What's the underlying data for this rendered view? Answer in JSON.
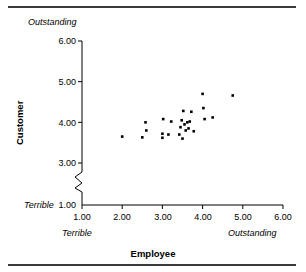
{
  "chart_data": {
    "type": "scatter",
    "title": "",
    "xlabel": "Employee",
    "ylabel": "Customer",
    "xlim": [
      1.0,
      6.0
    ],
    "ylim": [
      1.0,
      6.0
    ],
    "grid": false,
    "legend": null,
    "y_axis_break": true,
    "y_axis_break_between": [
      1.0,
      3.0
    ],
    "x_ticks": [
      "1.00",
      "2.00",
      "3.00",
      "4.00",
      "5.00",
      "6.00"
    ],
    "y_ticks": [
      "1.00",
      "3.00",
      "4.00",
      "5.00",
      "6.00"
    ],
    "x_scale_low_label": "Terrible",
    "x_scale_high_label": "Outstanding",
    "y_scale_low_label": "Terrible",
    "y_scale_high_label": "Outstanding",
    "marker": "square",
    "marker_color": "#000000",
    "points": [
      {
        "x": 2.0,
        "y": 3.65
      },
      {
        "x": 2.5,
        "y": 3.63
      },
      {
        "x": 2.58,
        "y": 4.0
      },
      {
        "x": 2.6,
        "y": 3.8
      },
      {
        "x": 3.0,
        "y": 3.72
      },
      {
        "x": 3.0,
        "y": 3.62
      },
      {
        "x": 3.02,
        "y": 4.08
      },
      {
        "x": 3.15,
        "y": 3.7
      },
      {
        "x": 3.22,
        "y": 4.02
      },
      {
        "x": 3.42,
        "y": 3.7
      },
      {
        "x": 3.45,
        "y": 3.88
      },
      {
        "x": 3.48,
        "y": 4.05
      },
      {
        "x": 3.5,
        "y": 3.6
      },
      {
        "x": 3.52,
        "y": 4.28
      },
      {
        "x": 3.55,
        "y": 3.95
      },
      {
        "x": 3.58,
        "y": 3.8
      },
      {
        "x": 3.62,
        "y": 4.0
      },
      {
        "x": 3.65,
        "y": 3.85
      },
      {
        "x": 3.68,
        "y": 4.02
      },
      {
        "x": 3.72,
        "y": 4.26
      },
      {
        "x": 3.78,
        "y": 3.78
      },
      {
        "x": 4.0,
        "y": 4.7
      },
      {
        "x": 4.02,
        "y": 4.35
      },
      {
        "x": 4.05,
        "y": 4.08
      },
      {
        "x": 4.25,
        "y": 4.12
      },
      {
        "x": 4.75,
        "y": 4.66
      }
    ]
  },
  "figure": {
    "top_rule": "",
    "bottom_rule": ""
  }
}
